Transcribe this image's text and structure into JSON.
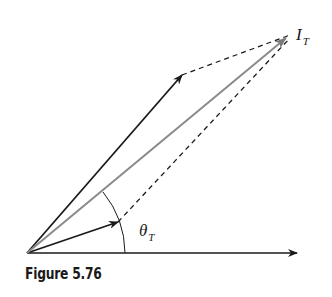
{
  "figure": {
    "caption": "Figure 5.76",
    "labels": {
      "resultant": "I",
      "resultant_sub": "T",
      "angle": "θ",
      "angle_sub": "T"
    },
    "colors": {
      "vector": "#1a1a1a",
      "resultant": "#8a8a8a",
      "dashed": "#1a1a1a"
    },
    "vectors": [
      {
        "name": "upper-vector",
        "from": [
          27,
          253
        ],
        "to": [
          182,
          75
        ]
      },
      {
        "name": "lower-vector",
        "from": [
          27,
          253
        ],
        "to": [
          118,
          222
        ]
      },
      {
        "name": "resultant-vector-I_T",
        "from": [
          27,
          253
        ],
        "to": [
          286,
          37
        ]
      },
      {
        "name": "reference-axis",
        "from": [
          27,
          253
        ],
        "to": [
          297,
          253
        ]
      }
    ],
    "dashed_lines": [
      {
        "from": [
          182,
          75
        ],
        "to": [
          290,
          35
        ]
      },
      {
        "from": [
          118,
          222
        ],
        "to": [
          290,
          35
        ]
      }
    ]
  }
}
